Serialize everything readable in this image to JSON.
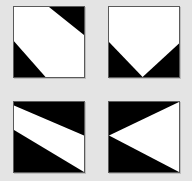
{
  "figure": {
    "background": "#e4e4e4",
    "border_color": "#5a5a5a",
    "fill_light": "#ffffff",
    "fill_dark": "#000000",
    "tiles": [
      {
        "id": "top-left",
        "description": "white square with black top-right and bottom-left corner triangles (diagonal band)",
        "dark_polygons": [
          "50,0 100,0 100,40",
          "0,49 0,100 45,100"
        ]
      },
      {
        "id": "top-right",
        "description": "white pentagon (home-plate) with black bottom corner triangles",
        "dark_polygons": [
          "0,50 0,100 48,100",
          "100,52 100,100 48,100"
        ]
      },
      {
        "id": "bottom-left",
        "description": "white diagonal band descending left to right between black regions",
        "dark_polygons": [
          "0,0 100,0 100,48 0,5",
          "0,40 100,100 0,100"
        ]
      },
      {
        "id": "bottom-right",
        "description": "white left-pointing triangle on black background",
        "dark_polygons": [
          "0,0 100,0 0,48",
          "0,48 100,100 0,100"
        ]
      }
    ]
  }
}
